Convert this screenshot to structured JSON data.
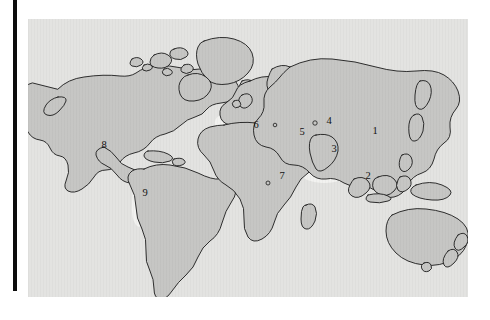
{
  "figure": {
    "kind": "world-distribution-map",
    "panel_background_color": "#e3e3e1",
    "land_fill_color": "#c6c6c4",
    "zone_fill_color": "#f2f2f0",
    "outline_color": "#1b1b1b",
    "left_bar_color": "#0d0d0d"
  },
  "map": {
    "zones": [
      {
        "id": "zone-1",
        "label": "1",
        "x": 375,
        "y": 132
      },
      {
        "id": "zone-2",
        "label": "2",
        "x": 368,
        "y": 177
      },
      {
        "id": "zone-3",
        "label": "3",
        "x": 334,
        "y": 150
      },
      {
        "id": "zone-4",
        "label": "4",
        "x": 329,
        "y": 122
      },
      {
        "id": "zone-5",
        "label": "5",
        "x": 302,
        "y": 133
      },
      {
        "id": "zone-6",
        "label": "6",
        "x": 256,
        "y": 126
      },
      {
        "id": "zone-7",
        "label": "7",
        "x": 282,
        "y": 177
      },
      {
        "id": "zone-8",
        "label": "8",
        "x": 104,
        "y": 146
      },
      {
        "id": "zone-9",
        "label": "9",
        "x": 145,
        "y": 194
      }
    ]
  }
}
